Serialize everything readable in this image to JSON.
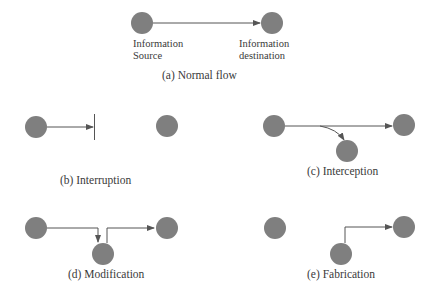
{
  "colors": {
    "node": "#7f7f7f",
    "line": "#555555",
    "text": "#3a3a3a",
    "background": "#ffffff"
  },
  "panels": {
    "a": {
      "caption": "(a) Normal flow",
      "source_label_line1": "Information",
      "source_label_line2": "Source",
      "destination_label_line1": "Information",
      "destination_label_line2": "destination"
    },
    "b": {
      "caption": "(b) Interruption"
    },
    "c": {
      "caption": "(c) Interception"
    },
    "d": {
      "caption": "(d) Modification"
    },
    "e": {
      "caption": "(e) Fabrication"
    }
  }
}
